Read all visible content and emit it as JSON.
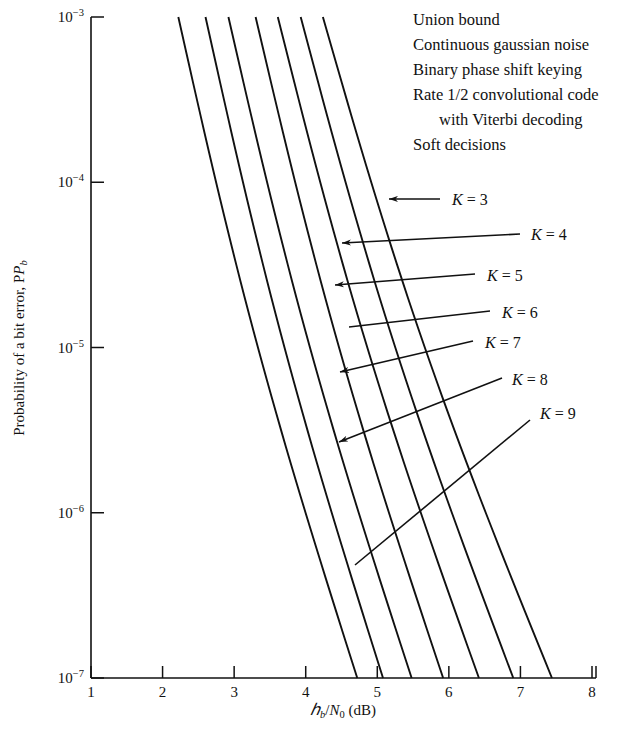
{
  "chart_data": {
    "type": "line",
    "title": "",
    "xlabel": "Eb/N0 (dB)",
    "ylabel": "Probability of a bit error, Pb",
    "xlim": [
      1,
      8
    ],
    "ylim": [
      1e-07,
      0.001
    ],
    "yscale": "log",
    "grid": false,
    "legend_position": "inline-annotations",
    "xticks": [
      1,
      2,
      3,
      4,
      5,
      6,
      7,
      8
    ],
    "xtick_labels": [
      "1",
      "2",
      "3",
      "4",
      "5",
      "6",
      "7",
      "8"
    ],
    "yticks": [
      0.001,
      0.0001,
      1e-05,
      1e-06,
      1e-07
    ],
    "ytick_labels": [
      "10−3",
      "10−4",
      "10−5",
      "10−6",
      "10−7"
    ],
    "ytick_mantissa": "10",
    "ytick_exponents": [
      "-3",
      "-4",
      "-5",
      "-6",
      "-7"
    ],
    "series": [
      {
        "name": "K = 3",
        "k": 3,
        "x": [
          2.22,
          4.72
        ],
        "y": [
          0.001,
          1e-07
        ]
      },
      {
        "name": "K = 4",
        "k": 4,
        "x": [
          2.6,
          5.08
        ],
        "y": [
          0.001,
          1e-07
        ]
      },
      {
        "name": "K = 5",
        "k": 5,
        "x": [
          2.92,
          5.48
        ],
        "y": [
          0.001,
          1e-07
        ]
      },
      {
        "name": "K = 6",
        "k": 6,
        "x": [
          3.3,
          5.92
        ],
        "y": [
          0.001,
          1e-07
        ]
      },
      {
        "name": "K = 7",
        "k": 7,
        "x": [
          3.61,
          6.42
        ],
        "y": [
          0.001,
          1e-07
        ]
      },
      {
        "name": "K = 8",
        "k": 8,
        "x": [
          3.93,
          6.9
        ],
        "y": [
          0.001,
          1e-07
        ]
      },
      {
        "name": "K = 9",
        "k": 9,
        "x": [
          4.24,
          7.44
        ],
        "y": [
          0.001,
          1e-07
        ]
      }
    ]
  },
  "notes": {
    "lines": [
      "Union bound",
      "Continuous gaussian noise",
      "Binary phase shift keying",
      "Rate 1/2 convolutional code",
      "with Viterbi decoding",
      "Soft decisions"
    ]
  },
  "annotations": {
    "items": [
      {
        "label": "K = 3",
        "k_symbol": "K",
        "equals": "=",
        "value": "3"
      },
      {
        "label": "K = 4",
        "k_symbol": "K",
        "equals": "=",
        "value": "4"
      },
      {
        "label": "K = 5",
        "k_symbol": "K",
        "equals": "=",
        "value": "5"
      },
      {
        "label": "K = 6",
        "k_symbol": "K",
        "equals": "=",
        "value": "6"
      },
      {
        "label": "K = 7",
        "k_symbol": "K",
        "equals": "=",
        "value": "7"
      },
      {
        "label": "K = 8",
        "k_symbol": "K",
        "equals": "=",
        "value": "8"
      },
      {
        "label": "K = 9",
        "k_symbol": "K",
        "equals": "=",
        "value": "9"
      }
    ]
  },
  "axes": {
    "x_title_parts": {
      "e": "ℰ",
      "b": "b",
      "slash": "/",
      "n": "N",
      "zero": "0",
      "unit": "(dB)"
    },
    "x_title_plain": "Eb/N0 (dB)",
    "y_title_plain": "Probability of a bit error, P",
    "y_title_sub": "b"
  },
  "colors": {
    "background": "#ffffff",
    "line": "#111111",
    "text": "#111111"
  }
}
